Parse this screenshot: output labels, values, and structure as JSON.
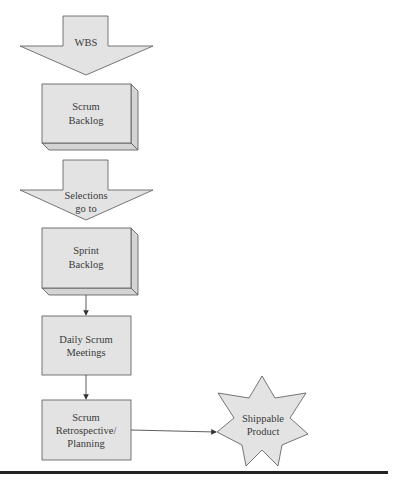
{
  "diagram": {
    "colors": {
      "fill": "#e3e3e3",
      "side": "#d4d4d4",
      "stroke": "#555555",
      "text": "#3a3a3a",
      "rule": "#222222"
    },
    "nodes": {
      "wbs": {
        "shape": "down-arrow",
        "lines": [
          "WBS"
        ]
      },
      "scrum_backlog": {
        "shape": "3d-box",
        "lines": [
          "Scrum",
          "Backlog"
        ]
      },
      "selections": {
        "shape": "down-arrow",
        "lines": [
          "Selections",
          "go to"
        ]
      },
      "sprint_backlog": {
        "shape": "3d-box",
        "lines": [
          "Sprint",
          "Backlog"
        ]
      },
      "daily_scrum": {
        "shape": "box",
        "lines": [
          "Daily Scrum",
          "Meetings"
        ]
      },
      "retrospective": {
        "shape": "box",
        "lines": [
          "Scrum",
          "Retrospective/",
          "Planning"
        ]
      },
      "shippable": {
        "shape": "7-point-star",
        "lines": [
          "Shippable",
          "Product"
        ]
      }
    },
    "edges": [
      {
        "from": "sprint_backlog",
        "to": "daily_scrum",
        "arrow": true
      },
      {
        "from": "daily_scrum",
        "to": "retrospective",
        "arrow": true
      },
      {
        "from": "retrospective",
        "to": "shippable",
        "arrow": true
      }
    ]
  }
}
